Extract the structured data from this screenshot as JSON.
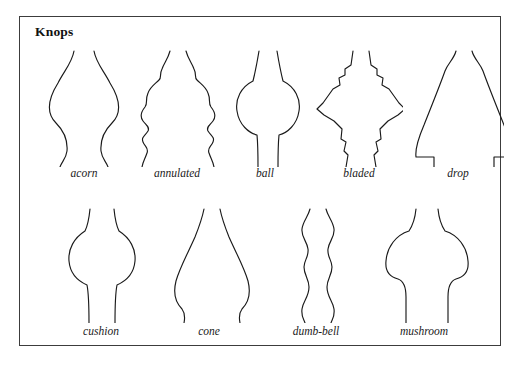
{
  "plate": {
    "title": "Knops",
    "border_color": "#3c3c3c",
    "ink_color": "#1a1a1a",
    "background": "#ffffff",
    "rows": 2
  },
  "figures": [
    {
      "name": "acorn",
      "label": "acorn",
      "row": 1,
      "column": 1,
      "x": 22,
      "y": 30,
      "width": 84,
      "height": 120,
      "label_x": 22,
      "label_y": 150,
      "left_path": "M 32 4 C 30 16 22 24 16 36 C 6 52 4 66 14 76 C 22 84 26 92 25 104 C 24 112 20 114 18 120",
      "right_path": "M 52 4 C 54 16 62 24 68 36 C 78 52 80 66 70 76 C 62 84 58 92 59 104 C 60 112 64 114 66 120"
    },
    {
      "name": "annulated",
      "label": "annulated",
      "row": 1,
      "column": 2,
      "x": 112,
      "y": 30,
      "width": 90,
      "height": 120,
      "label_x": 112,
      "label_y": 150,
      "left_path": "M 38 4 C 36 12 32 16 30 22 C 27 28 30 30 27 33 C 23 37 18 40 16 46 C 13 53 16 56 13 60 C 9 65 8 70 11 74 C 14 78 18 80 16 84 C 13 89 9 90 11 95 C 13 100 17 101 15 106 C 13 112 11 114 10 120",
      "right_path": "M 54 4 C 56 12 60 16 62 22 C 65 28 62 30 65 33 C 69 37 74 40 76 46 C 79 53 76 56 79 60 C 83 65 84 70 81 74 C 78 78 74 80 76 84 C 79 89 83 90 81 95 C 79 100 75 101 77 106 C 79 112 81 114 82 120"
    },
    {
      "name": "ball",
      "label": "ball",
      "row": 1,
      "column": 3,
      "x": 205,
      "y": 30,
      "width": 80,
      "height": 120,
      "label_x": 205,
      "label_y": 150,
      "left_path": "M 34 4 C 32 16 30 26 28 34 C 16 40 10 52 12 64 C 14 78 24 86 32 88 C 33 98 33 110 33 120",
      "right_path": "M 52 4 C 54 16 56 26 58 34 C 70 40 76 52 74 64 C 72 78 62 86 54 88 C 53 98 53 110 53 120"
    },
    {
      "name": "bladed",
      "label": "bladed",
      "row": 1,
      "column": 4,
      "x": 295,
      "y": 30,
      "width": 88,
      "height": 120,
      "label_x": 295,
      "label_y": 150,
      "left_path": "M 38 4 L 36 18 L 30 22 L 30 28 L 24 31 L 25 38 L 18 42 L 8 56 L 2 62 L 9 68 L 19 74 L 27 82 L 26 92 L 31 95 L 29 104 L 33 108 L 31 120",
      "right_path": "M 54 4 L 56 18 L 62 22 L 62 28 L 68 31 L 67 38 L 74 42 L 84 56 L 90 62 L 83 68 L 73 74 L 65 82 L 66 92 L 61 95 L 63 104 L 59 108 L 61 120"
    },
    {
      "name": "drop",
      "label": "drop",
      "row": 1,
      "column": 5,
      "x": 392,
      "y": 30,
      "width": 92,
      "height": 120,
      "label_x": 392,
      "label_y": 150,
      "left_path": "M 44 4 C 42 12 36 16 33 24 C 28 38 20 58 12 78 C 6 92 3 102 4 110 L 22 110 L 22 120",
      "right_path": "M 60 4 C 62 12 68 16 71 24 C 76 38 84 58 92 78 C 98 92 101 102 100 110 L 82 110 L 82 120"
    },
    {
      "name": "cushion",
      "label": "cushion",
      "row": 2,
      "column": 1,
      "x": 38,
      "y": 188,
      "width": 86,
      "height": 118,
      "label_x": 38,
      "label_y": 308,
      "left_path": "M 32 4 C 31 14 30 20 27 26 C 16 33 10 44 11 56 C 12 68 20 76 29 80 C 31 90 31 106 31 118",
      "right_path": "M 56 4 C 57 14 58 20 61 26 C 72 33 78 44 77 56 C 76 68 68 76 59 80 C 57 90 57 106 57 118"
    },
    {
      "name": "cone",
      "label": "cone",
      "row": 2,
      "column": 2,
      "x": 146,
      "y": 188,
      "width": 86,
      "height": 118,
      "label_x": 146,
      "label_y": 308,
      "left_path": "M 38 4 C 36 14 33 22 29 32 C 22 48 14 62 10 76 C 7 88 10 98 16 104 C 19 108 19 113 18 118",
      "right_path": "M 54 4 C 56 14 59 22 63 32 C 70 48 78 62 82 76 C 85 88 82 98 76 104 C 73 108 73 113 74 118"
    },
    {
      "name": "dumb-bell",
      "label": "dumb-bell",
      "row": 2,
      "column": 3,
      "x": 252,
      "y": 188,
      "width": 88,
      "height": 118,
      "label_x": 252,
      "label_y": 308,
      "left_path": "M 38 4 C 36 12 31 16 30 24 C 29 32 35 36 36 44 C 37 52 32 55 32 62 C 32 70 37 74 37 82 C 37 92 31 96 30 104 C 29 112 32 114 33 118",
      "right_path": "M 54 4 C 56 12 61 16 62 24 C 63 32 57 36 56 44 C 55 52 60 55 60 62 C 60 70 55 74 55 82 C 55 92 61 96 62 104 C 63 112 60 114 59 118"
    },
    {
      "name": "mushroom",
      "label": "mushroom",
      "row": 2,
      "column": 4,
      "x": 358,
      "y": 188,
      "width": 92,
      "height": 118,
      "label_x": 358,
      "label_y": 308,
      "left_path": "M 38 4 C 37 14 35 20 31 26 C 18 30 9 42 8 56 C 7 66 12 72 20 74 C 26 76 28 82 28 92 C 28 104 28 112 28 118",
      "right_path": "M 60 4 C 61 14 63 20 67 26 C 80 30 89 42 90 56 C 91 66 86 72 78 74 C 72 76 70 82 70 92 C 70 104 70 112 70 118"
    }
  ]
}
